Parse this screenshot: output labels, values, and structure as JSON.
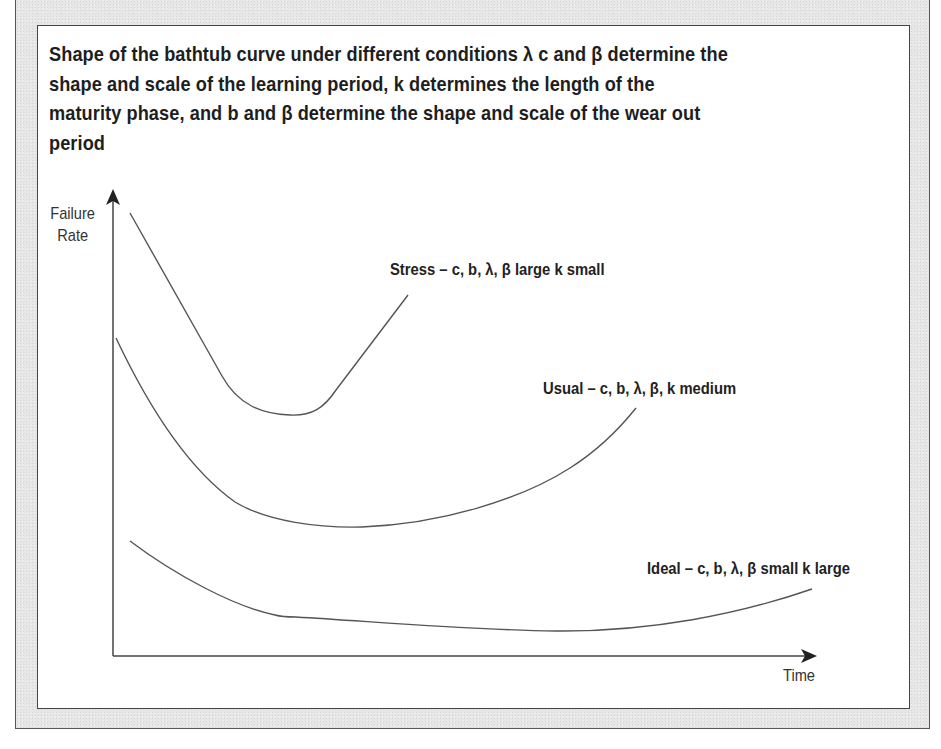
{
  "figure": {
    "title_lines": [
      "Shape of the bathtub curve under different conditions λ c and β determine the",
      "shape and scale of the learning period, k determines the length of the",
      "maturity phase, and b and β determine the shape and scale of the wear out",
      "period"
    ],
    "y_axis": {
      "label_line1": "Failure",
      "label_line2": "Rate"
    },
    "x_axis": {
      "label": "Time"
    },
    "curves": [
      {
        "name": "stress",
        "label": "Stress – c, b, λ, β large k small"
      },
      {
        "name": "usual",
        "label": "Usual – c, b, λ, β, k medium"
      },
      {
        "name": "ideal",
        "label": "Ideal – c, b, λ, β small k large"
      }
    ],
    "colors": {
      "frame": "#e6e6e6",
      "border": "#444444",
      "curve": "#555555",
      "text": "#1e1e1e"
    }
  }
}
